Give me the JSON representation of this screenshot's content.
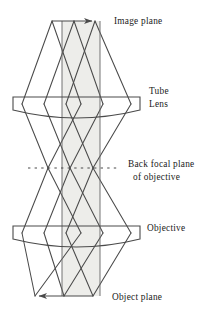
{
  "figure": {
    "type": "optical-ray-diagram",
    "background_color": "#ffffff",
    "ray_color": "#4a4a4a",
    "outline_color": "#4a4a4a",
    "shaded_band_color": "#ededea"
  },
  "labels": {
    "image_plane": "Image plane",
    "tube": "Tube",
    "lens": "Lens",
    "back_focal_plane": "Back focal plane",
    "of_objective": "of objective",
    "objective": "Objective",
    "object_plane": "Object plane"
  },
  "elements": {
    "tube_lens": {
      "name": "Tube Lens",
      "shape": "plano-convex",
      "left": 13,
      "right": 140,
      "top_y": 97,
      "edge_bottom_y": 110,
      "center_bottom_y": 117
    },
    "objective_lens": {
      "name": "Objective",
      "shape": "plano-convex",
      "left": 13,
      "right": 140,
      "top_y": 226,
      "edge_bottom_y": 239,
      "center_bottom_y": 246
    },
    "image_plane": {
      "y": 21,
      "arrow_from_x": 52,
      "arrow_to_x": 95,
      "arrow_direction": "right"
    },
    "object_plane": {
      "y": 296,
      "arrow_from_x": 93,
      "arrow_to_x": 35,
      "arrow_direction": "left"
    },
    "back_focal_plane": {
      "y": 168,
      "dash_from_x": 28,
      "dash_to_x": 118,
      "crossing_points_x": [
        48,
        93
      ]
    },
    "shaded_band": {
      "left_x": 62,
      "right_x": 100,
      "top_y": 21,
      "bottom_y": 296
    }
  },
  "ray_geometry": {
    "image_plane_points_x": [
      52,
      74,
      95
    ],
    "object_plane_points_x": [
      35,
      64,
      93
    ],
    "tube_lens_aperture_x": [
      22,
      81,
      131
    ],
    "objective_aperture_x": [
      22,
      81,
      131
    ],
    "focal_crossings_x": [
      48,
      93
    ]
  }
}
